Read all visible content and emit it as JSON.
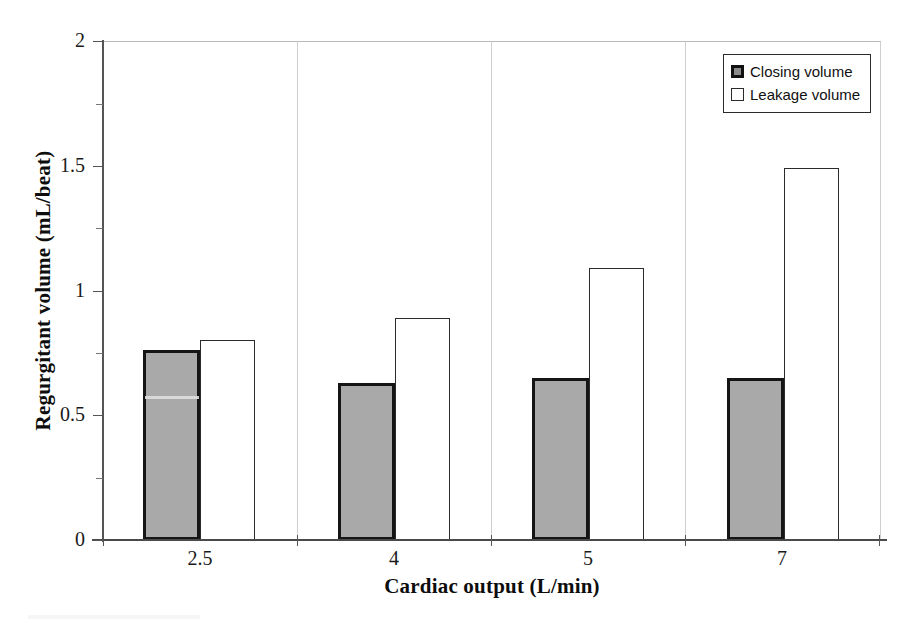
{
  "chart_data": {
    "type": "bar",
    "title": "",
    "xlabel": "Cardiac output (L/min)",
    "ylabel": "Regurgitant volume (mL/beat)",
    "categories": [
      "2.5",
      "4",
      "5",
      "7"
    ],
    "series": [
      {
        "name": "Closing volume",
        "values": [
          0.76,
          0.63,
          0.65,
          0.65
        ],
        "fill": "#a9a9a9",
        "stroke": "#151515"
      },
      {
        "name": "Leakage volume",
        "values": [
          0.8,
          0.89,
          1.09,
          1.49
        ],
        "fill": "#ffffff",
        "stroke": "#2b2b2b"
      }
    ],
    "ylim": [
      0,
      2
    ],
    "ytick_labels": [
      "0",
      "0.5",
      "1",
      "1.5",
      "2"
    ],
    "ytick_values": [
      0,
      0.5,
      1,
      1.5,
      2
    ],
    "yminor_values": [
      0.25,
      0.75,
      1.25,
      1.75
    ],
    "grid": false,
    "legend_position": "top-right",
    "legend_entries": [
      "Closing volume",
      "Leakage volume"
    ]
  },
  "axes": {
    "y_title": "Regurgitant volume (mL/beat)",
    "x_title": "Cardiac output (L/min)",
    "y_labels": {
      "t0": "0",
      "t1": "0.5",
      "t2": "1",
      "t3": "1.5",
      "t4": "2"
    },
    "x_labels": {
      "c0": "2.5",
      "c1": "4",
      "c2": "5",
      "c3": "7"
    }
  },
  "legend": {
    "items": [
      {
        "label": "Closing volume",
        "swatch": "filled-gray-square-icon"
      },
      {
        "label": "Leakage volume",
        "swatch": "empty-square-icon"
      }
    ]
  }
}
